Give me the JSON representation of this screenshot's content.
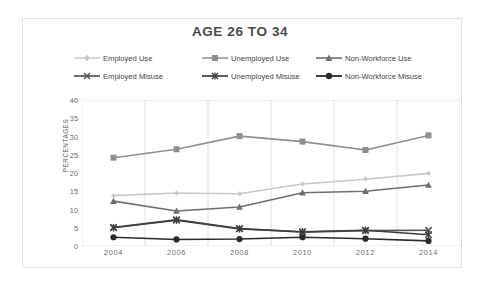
{
  "chart_data": {
    "type": "line",
    "title": "AGE 26 TO 34",
    "xlabel": "",
    "ylabel": "PERCENTAGES",
    "categories": [
      "2004",
      "2006",
      "2008",
      "2010",
      "2012",
      "2014"
    ],
    "x": [
      2004,
      2006,
      2008,
      2010,
      2012,
      2014
    ],
    "ylim": [
      0,
      40
    ],
    "yticks": [
      "0",
      "5",
      "10",
      "15",
      "20",
      "25",
      "30",
      "35",
      "40"
    ],
    "ytick_values": [
      0,
      5,
      10,
      15,
      20,
      25,
      30,
      35,
      40
    ],
    "grid": "vertical-only",
    "legend_position": "top",
    "series": [
      {
        "name": "Employed Use",
        "values": [
          13.8,
          14.5,
          14.3,
          17.0,
          18.3,
          19.9
        ],
        "color": "#c8c8c8",
        "marker": "diamond"
      },
      {
        "name": "Unemployed Use",
        "values": [
          24.2,
          26.5,
          30.1,
          28.6,
          26.3,
          30.3
        ],
        "color": "#8f8f8f",
        "marker": "square"
      },
      {
        "name": "Non-Workforce Use",
        "values": [
          12.3,
          9.6,
          10.7,
          14.6,
          15.0,
          16.7
        ],
        "color": "#6e6e6e",
        "marker": "triangle"
      },
      {
        "name": "Employed Misuse",
        "values": [
          5.1,
          7.2,
          4.8,
          3.8,
          4.2,
          4.3
        ],
        "color": "#555555",
        "marker": "x"
      },
      {
        "name": "Unemployed Misuse",
        "values": [
          5.0,
          7.1,
          4.7,
          3.9,
          4.3,
          3.1
        ],
        "color": "#3d3d3d",
        "marker": "asterisk"
      },
      {
        "name": "Non-Workforce Misuse",
        "values": [
          2.4,
          1.8,
          1.9,
          2.4,
          2.0,
          1.4
        ],
        "color": "#2b2b2b",
        "marker": "circle"
      }
    ]
  },
  "title": {
    "text": "AGE 26 TO 34"
  },
  "axes": {
    "y_title": "PERCENTAGES",
    "y_labels": [
      "40",
      "35",
      "30",
      "25",
      "20",
      "15",
      "10",
      "5",
      "0"
    ],
    "x_labels": [
      "2004",
      "2006",
      "2008",
      "2010",
      "2012",
      "2014"
    ]
  },
  "legend": {
    "rows": [
      [
        {
          "label": "Employed Use",
          "color": "#c8c8c8",
          "marker": "diamond"
        },
        {
          "label": "Unemployed Use",
          "color": "#8f8f8f",
          "marker": "square"
        },
        {
          "label": "Non-Workforce Use",
          "color": "#6e6e6e",
          "marker": "triangle"
        }
      ],
      [
        {
          "label": "Employed Misuse",
          "color": "#555555",
          "marker": "x"
        },
        {
          "label": "Unemployed Misuse",
          "color": "#3d3d3d",
          "marker": "asterisk"
        },
        {
          "label": "Non-Workforce Misuse",
          "color": "#2b2b2b",
          "marker": "circle"
        }
      ]
    ]
  },
  "colors": {
    "background": "#ffffff",
    "frame": "#e2e2e2",
    "gridline": "#d9d9d9",
    "axis_text": "#6a6a6a",
    "title_text": "#4a4a4a"
  }
}
